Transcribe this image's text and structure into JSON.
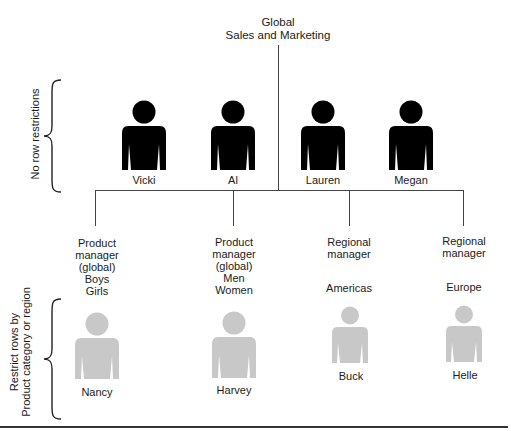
{
  "title": {
    "line1": "Global",
    "line2": "Sales and Marketing"
  },
  "groups": {
    "top": {
      "label": "No row restrictions"
    },
    "bottom": {
      "label_line1": "Restrict rows by",
      "label_line2": "Product category or region"
    }
  },
  "unrestricted_people": [
    {
      "name": "Vicki",
      "icon": "person-icon-black",
      "color": "#000000"
    },
    {
      "name": "Al",
      "icon": "person-icon-black",
      "color": "#000000"
    },
    {
      "name": "Lauren",
      "icon": "person-icon-black",
      "color": "#000000"
    },
    {
      "name": "Megan",
      "icon": "person-icon-black",
      "color": "#000000"
    }
  ],
  "restricted_roles": [
    {
      "role_lines": [
        "Product",
        "manager",
        "(global)"
      ],
      "scope_lines": [
        "Boys",
        "Girls"
      ],
      "person": "Nancy",
      "icon": "person-icon-grey",
      "color": "#c8c8c8"
    },
    {
      "role_lines": [
        "Product",
        "manager",
        "(global)"
      ],
      "scope_lines": [
        "Men",
        "Women"
      ],
      "person": "Harvey",
      "icon": "person-icon-grey",
      "color": "#c8c8c8"
    },
    {
      "role_lines": [
        "Regional",
        "manager"
      ],
      "scope_lines": [
        "Americas"
      ],
      "person": "Buck",
      "icon": "person-icon-grey",
      "color": "#c8c8c8"
    },
    {
      "role_lines": [
        "Regional",
        "manager"
      ],
      "scope_lines": [
        "Europe"
      ],
      "person": "Helle",
      "icon": "person-icon-grey",
      "color": "#c8c8c8"
    }
  ]
}
